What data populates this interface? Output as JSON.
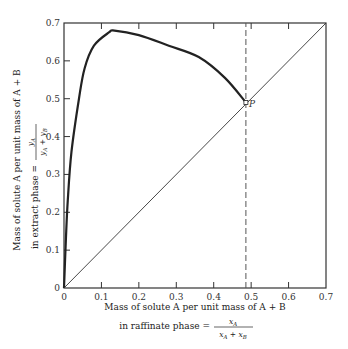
{
  "chart_data": {
    "type": "line",
    "title": "",
    "xlabel": {
      "line1": "Mass of solute A per unit mass of A + B",
      "line2_prefix": "in raffinate phase =",
      "numerator": "x_A",
      "denominator": "x_A + x_B"
    },
    "ylabel": {
      "line1": "Mass of solute A per unit mass of A + B",
      "line2_prefix": "in extract phase =",
      "numerator": "y_A",
      "denominator": "y_A + y_B"
    },
    "xlim": [
      0,
      0.7
    ],
    "ylim": [
      0,
      0.7
    ],
    "x_ticks": [
      "0",
      "0.1",
      "0.2",
      "0.3",
      "0.4",
      "0.5",
      "0.6",
      "0.7"
    ],
    "y_ticks": [
      "0",
      "0.1",
      "0.2",
      "0.3",
      "0.4",
      "0.5",
      "0.6",
      "0.7"
    ],
    "grid": false,
    "series": [
      {
        "name": "Equilibrium curve",
        "style": "solid-thick",
        "x": [
          0,
          0.005,
          0.01,
          0.02,
          0.04,
          0.055,
          0.08,
          0.12,
          0.135,
          0.2,
          0.28,
          0.36,
          0.43,
          0.486
        ],
        "y": [
          0,
          0.127,
          0.23,
          0.36,
          0.5,
          0.58,
          0.64,
          0.675,
          0.68,
          0.668,
          0.64,
          0.61,
          0.555,
          0.49
        ]
      },
      {
        "name": "45° diagonal (y = x)",
        "style": "solid-thin",
        "x": [
          0,
          0.7
        ],
        "y": [
          0,
          0.7
        ]
      },
      {
        "name": "Plait point vertical",
        "style": "dashed",
        "x": [
          0.486,
          0.486
        ],
        "y": [
          0,
          0.7
        ]
      }
    ],
    "annotations": [
      {
        "text": "P",
        "x": 0.486,
        "y": 0.49,
        "note": "plait point on diagonal"
      }
    ]
  }
}
